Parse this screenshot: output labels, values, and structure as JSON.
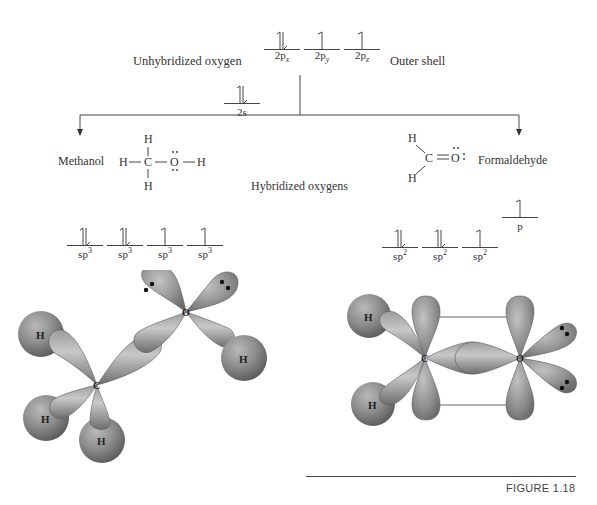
{
  "top": {
    "left_label": "Unhybridized oxygen",
    "right_label": "Outer shell",
    "orbitals": [
      {
        "name": "2s",
        "base": "2s",
        "subscript": "",
        "electrons": "paired"
      },
      {
        "name": "2px",
        "base": "2p",
        "subscript": "x",
        "electrons": "paired"
      },
      {
        "name": "2py",
        "base": "2p",
        "subscript": "y",
        "electrons": "single"
      },
      {
        "name": "2pz",
        "base": "2p",
        "subscript": "z",
        "electrons": "single"
      }
    ]
  },
  "branches": {
    "left": {
      "name": "Methanol",
      "structure": {
        "atoms": [
          "H",
          "H",
          "C",
          "O",
          "H",
          "H"
        ],
        "top_h": "H",
        "bottom_h": "H",
        "left_h": "H",
        "carbon": "C",
        "oxygen": "O",
        "right_h": "H",
        "lone_pairs_on_oxygen": 2
      }
    },
    "right": {
      "name": "Formaldehyde",
      "structure": {
        "upper_h": "H",
        "lower_h": "H",
        "carbon": "C",
        "oxygen": "O",
        "bond": "double",
        "lone_pairs_on_oxygen": 2
      }
    },
    "center_label": "Hybridized oxygens"
  },
  "hybrid_left": {
    "orbitals": [
      {
        "base": "sp",
        "superscript": "3",
        "electrons": "paired"
      },
      {
        "base": "sp",
        "superscript": "3",
        "electrons": "paired"
      },
      {
        "base": "sp",
        "superscript": "3",
        "electrons": "single"
      },
      {
        "base": "sp",
        "superscript": "3",
        "electrons": "single"
      }
    ],
    "model": {
      "atoms": {
        "carbon": "C",
        "oxygen": "O",
        "hydrogens": [
          "H",
          "H",
          "H",
          "H"
        ]
      },
      "lone_pairs": 2
    }
  },
  "hybrid_right": {
    "orbitals": [
      {
        "base": "sp",
        "superscript": "2",
        "electrons": "paired"
      },
      {
        "base": "sp",
        "superscript": "2",
        "electrons": "paired"
      },
      {
        "base": "sp",
        "superscript": "2",
        "electrons": "single"
      }
    ],
    "p_orbital": {
      "base": "p",
      "electrons": "single"
    },
    "model": {
      "atoms": {
        "carbon": "C",
        "oxygen": "O",
        "hydrogens": [
          "H",
          "H"
        ]
      },
      "lone_pairs": 2
    }
  },
  "caption": "FIGURE 1.18",
  "colors": {
    "lobe": "#8a8a8a",
    "lobe_light": "#c4c4c4",
    "lobe_dark": "#5e5e5e",
    "line": "#444444",
    "text": "#333333",
    "caption_rule": "#444444"
  }
}
